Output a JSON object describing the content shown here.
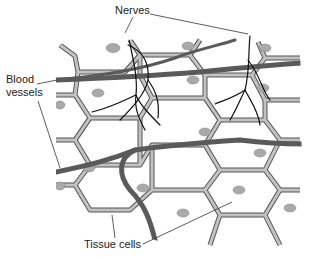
{
  "diagram": {
    "type": "biology-tissue-illustration",
    "labels": {
      "nerves": "Nerves",
      "blood_vessels_line1": "Blood",
      "blood_vessels_line2": "vessels",
      "tissue_cells": "Tissue cells"
    },
    "colors": {
      "background": "#ffffff",
      "cell_wall": "#b8b8b8",
      "cell_wall_outline": "#555555",
      "nucleus": "#a9a9a9",
      "blood_vessel": "#5a5a5a",
      "nerve": "#111111",
      "leader_line": "#333333",
      "text": "#222222"
    }
  }
}
